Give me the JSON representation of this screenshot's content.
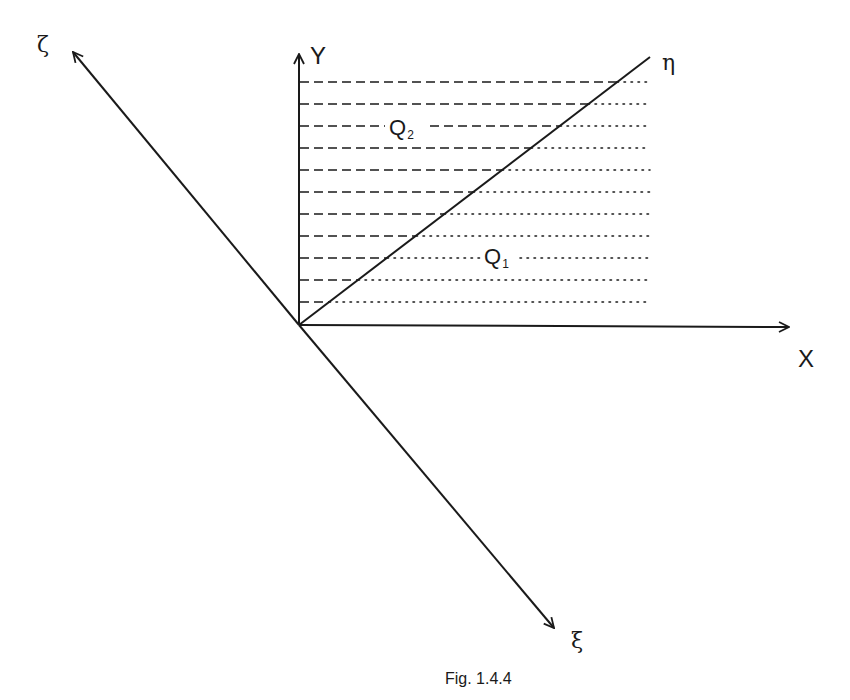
{
  "figure": {
    "caption": "Fig. 1.4.4",
    "colors": {
      "stroke": "#1a1a1a",
      "background": "#ffffff"
    },
    "axes": {
      "X": {
        "label": "X"
      },
      "Y": {
        "label": "Y"
      },
      "eta": {
        "label": "η"
      },
      "zeta": {
        "label": "ζ"
      },
      "xi": {
        "label": "ξ"
      }
    },
    "regions": {
      "Q1": {
        "letter": "Q",
        "subscript": "1"
      },
      "Q2": {
        "letter": "Q",
        "subscript": "2"
      }
    },
    "hatching": {
      "line_count": 11,
      "above_eta_style": "dashed",
      "below_eta_style": "dotted"
    }
  }
}
